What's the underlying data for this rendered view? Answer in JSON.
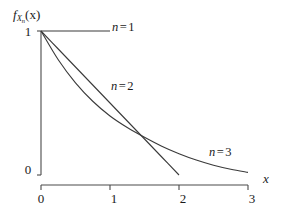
{
  "figure": {
    "background": "#ffffff",
    "ink_color": "#1a1a1a"
  },
  "axes": {
    "y_label": "f",
    "y_label_sub": "X",
    "y_label_sub_sub": "n",
    "y_label_arg": "(x)",
    "x_label": "x",
    "y_ticks": [
      "1",
      "0"
    ],
    "x_ticks": [
      "0",
      "1",
      "2",
      "3"
    ]
  },
  "series_labels": {
    "n1": {
      "var": "n",
      "eq": "=",
      "num": "1"
    },
    "n2": {
      "var": "n",
      "eq": "=",
      "num": "2"
    },
    "n3": {
      "var": "n",
      "eq": "=",
      "num": "3"
    }
  },
  "chart_data": {
    "type": "line",
    "title": "",
    "xlabel": "x",
    "ylabel": "f_{X_n}(x)",
    "xlim": [
      0,
      3
    ],
    "ylim": [
      0,
      1
    ],
    "xticks": [
      0,
      1,
      2,
      3
    ],
    "yticks": [
      0,
      1
    ],
    "grid": false,
    "legend": "inline-annotations",
    "line_color": "#3a3a3a",
    "series": [
      {
        "name": "n = 1",
        "description": "Uniform density on [0,1]: constant value 1 for 0 <= x <= 1",
        "x": [
          0,
          0.25,
          0.5,
          0.75,
          1
        ],
        "values": [
          1,
          1,
          1,
          1,
          1
        ]
      },
      {
        "name": "n = 2",
        "description": "Triangular density: linear decrease from 1 at x=0 to 0 at x=2",
        "x": [
          0,
          0.25,
          0.5,
          0.75,
          1,
          1.25,
          1.5,
          1.75,
          2
        ],
        "values": [
          1,
          0.875,
          0.75,
          0.625,
          0.5,
          0.375,
          0.25,
          0.125,
          0
        ]
      },
      {
        "name": "n = 3",
        "description": "Convex decaying density from 1 at x=0 approaching 0 near x=3",
        "x": [
          0,
          0.25,
          0.5,
          0.75,
          1,
          1.25,
          1.5,
          1.75,
          2,
          2.25,
          2.5,
          2.75,
          3
        ],
        "values": [
          1,
          0.8,
          0.64,
          0.512,
          0.41,
          0.33,
          0.262,
          0.2,
          0.148,
          0.104,
          0.068,
          0.04,
          0.018
        ]
      }
    ]
  }
}
